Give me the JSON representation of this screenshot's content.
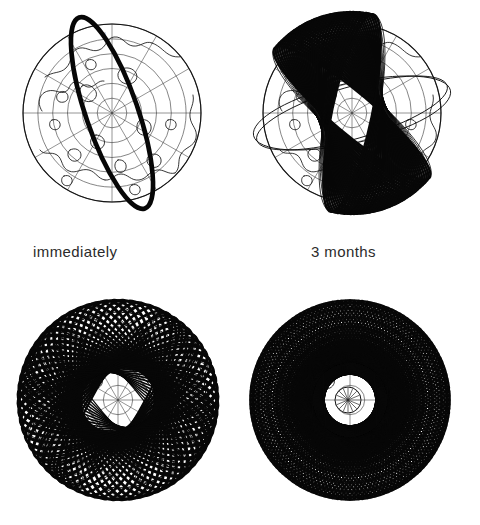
{
  "figure": {
    "background_color": "#ffffff",
    "ink_color": "#141414",
    "panel_count": 4,
    "layout": "2x2 grid, captions between upper and lower rows"
  },
  "captions": {
    "left": "immediately",
    "right": "3 months"
  },
  "panels": [
    {
      "id": "panel-tl",
      "position": "top-left",
      "caption": "immediately",
      "kind": "globe-with-orbit",
      "description": "North polar projection globe with a single heavy orbit ellipse",
      "globe": {
        "cx": 112,
        "cy": 113,
        "r": 89,
        "projection": "north-polar",
        "lat_circles": 6,
        "meridians": 12
      },
      "orbit_traces": 1,
      "orbit_tilt_deg": -19,
      "fan_span_deg": 0
    },
    {
      "id": "panel-tr",
      "position": "top-right",
      "caption": "3 months",
      "kind": "globe-with-orbit-fan",
      "description": "Same globe with orbit planes precessed into a dense dark wedge",
      "globe": {
        "cx": 352,
        "cy": 113,
        "r": 89,
        "projection": "north-polar",
        "lat_circles": 6,
        "meridians": 12
      },
      "orbit_traces": 34,
      "orbit_tilt_deg": -19,
      "fan_span_deg": 62
    },
    {
      "id": "panel-bl",
      "position": "bottom-left",
      "caption": "",
      "kind": "orbit-shell-partial",
      "description": "Globe nearly hidden beneath many precessed orbits covering most longitudes",
      "globe": {
        "cx": 118,
        "cy": 400,
        "r": 88,
        "projection": "north-polar",
        "lat_circles": 6,
        "meridians": 12
      },
      "orbit_traces": 56,
      "fan_span_deg": 290
    },
    {
      "id": "panel-br",
      "position": "bottom-right",
      "caption": "",
      "kind": "orbit-shell-full",
      "description": "Orbits precessed through all longitudes forming a complete shell with open polar hole",
      "globe": {
        "cx": 350,
        "cy": 400,
        "r": 88,
        "projection": "north-polar",
        "lat_circles": 6,
        "meridians": 12
      },
      "orbit_traces": 72,
      "fan_span_deg": 360,
      "polar_hole_radius": 13
    }
  ]
}
